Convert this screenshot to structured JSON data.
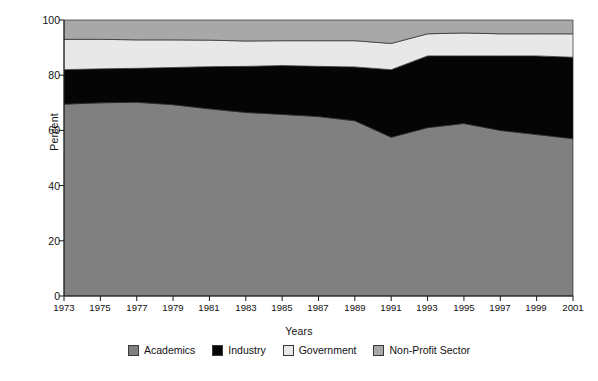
{
  "chart_data": {
    "type": "area",
    "title": "",
    "subtitle": "",
    "xlabel": "Years",
    "ylabel": "Percent",
    "stacked": true,
    "grid": false,
    "legend_position": "bottom",
    "xlim": [
      1973,
      2001
    ],
    "ylim": [
      0,
      100
    ],
    "yticks": [
      0,
      20,
      40,
      60,
      80,
      100
    ],
    "xticks": [
      1973,
      1975,
      1977,
      1979,
      1981,
      1983,
      1985,
      1987,
      1989,
      1991,
      1993,
      1995,
      1997,
      1999,
      2001
    ],
    "x": [
      1973,
      1975,
      1977,
      1979,
      1981,
      1983,
      1985,
      1987,
      1989,
      1991,
      1993,
      1995,
      1997,
      1999,
      2001
    ],
    "categories": [
      "1973",
      "1975",
      "1977",
      "1979",
      "1981",
      "1983",
      "1985",
      "1987",
      "1989",
      "1991",
      "1993",
      "1995",
      "1997",
      "1999",
      "2001"
    ],
    "series": [
      {
        "name": "Academics",
        "color": "#808080",
        "values": [
          69.5,
          70.0,
          70.2,
          69.3,
          67.8,
          66.5,
          65.8,
          65.0,
          63.5,
          57.5,
          61.0,
          62.5,
          60.0,
          58.5,
          57.0
        ]
      },
      {
        "name": "Industry",
        "color": "#050505",
        "values": [
          12.5,
          12.3,
          12.3,
          13.5,
          15.3,
          16.7,
          17.7,
          18.2,
          19.5,
          24.5,
          26.0,
          24.5,
          27.0,
          28.5,
          29.5
        ]
      },
      {
        "name": "Government",
        "color": "#e8e8e8",
        "values": [
          11.0,
          10.7,
          10.3,
          10.0,
          9.6,
          9.2,
          9.0,
          9.3,
          9.5,
          9.5,
          8.0,
          8.3,
          8.0,
          8.0,
          8.5
        ]
      },
      {
        "name": "Non-Profit Sector",
        "color": "#a8a8a8",
        "values": [
          7.0,
          7.0,
          7.2,
          7.2,
          7.3,
          7.6,
          7.5,
          7.5,
          7.5,
          8.5,
          5.0,
          4.7,
          5.0,
          5.0,
          5.0
        ]
      }
    ],
    "cumulative_top_boundaries": {
      "academics": [
        69.5,
        70.0,
        70.2,
        69.3,
        67.8,
        66.5,
        65.8,
        65.0,
        63.5,
        57.5,
        61.0,
        62.5,
        60.0,
        58.5,
        57.0
      ],
      "industry": [
        82.0,
        82.3,
        82.5,
        82.8,
        83.1,
        83.2,
        83.5,
        83.2,
        83.0,
        82.0,
        87.0,
        87.0,
        87.0,
        87.0,
        86.5
      ],
      "government": [
        93.0,
        93.0,
        92.8,
        92.8,
        92.7,
        92.4,
        92.5,
        92.5,
        92.5,
        91.5,
        95.0,
        95.3,
        95.0,
        95.0,
        95.0
      ],
      "non_profit": [
        100,
        100,
        100,
        100,
        100,
        100,
        100,
        100,
        100,
        100,
        100,
        100,
        100,
        100,
        100
      ]
    }
  },
  "axes": {
    "ylabel": "Percent",
    "xlabel": "Years",
    "ytick_labels": [
      "100",
      "80",
      "60",
      "40",
      "20",
      "0"
    ],
    "xtick_labels": [
      "1973",
      "1975",
      "1977",
      "1979",
      "1981",
      "1983",
      "1985",
      "1987",
      "1989",
      "1991",
      "1993",
      "1995",
      "1997",
      "1999",
      "2001"
    ]
  },
  "legend": {
    "items": [
      {
        "label": "Academics",
        "color": "#808080"
      },
      {
        "label": "Industry",
        "color": "#050505"
      },
      {
        "label": "Government",
        "color": "#e8e8e8"
      },
      {
        "label": "Non-Profit Sector",
        "color": "#a8a8a8"
      }
    ]
  }
}
